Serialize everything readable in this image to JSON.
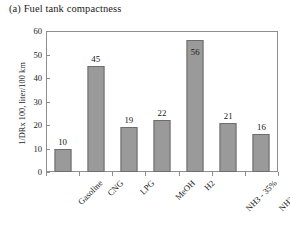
{
  "chart_data": {
    "type": "bar",
    "title": "(a) Fuel tank compactness",
    "xlabel": "",
    "ylabel": "1/DRx 100, liter/100 km",
    "categories": [
      "Gasoline",
      "CNG",
      "LPG",
      "MeOH",
      "H2",
      "NH3 - 35%",
      "NH3 - 45%"
    ],
    "values": [
      10,
      45,
      19,
      22,
      56,
      21,
      16
    ],
    "data_labels": [
      "10",
      "45",
      "19",
      "22",
      "56",
      "21",
      "16"
    ],
    "label_placement": [
      "outside",
      "outside",
      "outside",
      "outside",
      "inside",
      "outside",
      "outside"
    ],
    "ylim": [
      0,
      60
    ],
    "yticks": [
      0,
      10,
      20,
      30,
      40,
      50,
      60
    ],
    "ytick_labels": [
      "0",
      "10",
      "20",
      "30",
      "40",
      "50",
      "60"
    ],
    "grid": false,
    "legend": false,
    "bar_color": "#9a9a9a",
    "bar_edge_color": "#6d6d6d",
    "frame_color": "#8e8e8e",
    "background": "#ffffff",
    "xlabel_rotation": -45
  }
}
